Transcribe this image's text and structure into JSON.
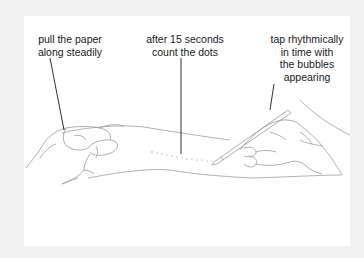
{
  "diagram": {
    "background_color": "#f2f2f2",
    "panel_color": "#ffffff",
    "line_color": "#1a1a1a",
    "drawing_color": "#9a9a9a",
    "labels": [
      {
        "id": "pull-paper",
        "lines": [
          "pull the paper",
          "along steadily"
        ],
        "points_to": "left hand holding paper"
      },
      {
        "id": "count-dots",
        "lines": [
          "after 15 seconds",
          "count the dots"
        ],
        "points_to": "dotted trail on paper"
      },
      {
        "id": "tap-rhythmically",
        "lines": [
          "tap rhythmically",
          "in time with",
          "the bubbles",
          "appearing"
        ],
        "points_to": "right hand holding pencil"
      }
    ],
    "figures": [
      "left-hand",
      "paper-sheet",
      "dot-trail",
      "right-hand",
      "pencil"
    ]
  }
}
